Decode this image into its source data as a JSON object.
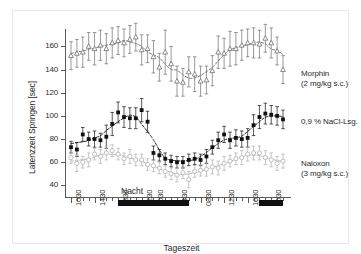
{
  "axes": {
    "ylabel": "Latenzzeit Springen [sec]",
    "xlabel": "Tageszeit",
    "yticks": [
      40,
      60,
      80,
      100,
      120,
      140,
      160
    ],
    "xticklabels": [
      "1030",
      "1430",
      "1830",
      "2230",
      "0030",
      "0430",
      "0830",
      "1230",
      "1630",
      "2030"
    ]
  },
  "annotations": {
    "night_label": "Nacht"
  },
  "legend": {
    "morphin_line1": "Morphin",
    "morphin_line2": "(2 mg/kg s.c.)",
    "nacl_line1": "0,9 % NaCl-Lsg.",
    "naloxon_line1": "Naloxon",
    "naloxon_line2": "(3 mg/kg s.c.)"
  },
  "colors": {
    "morphin": "#6f6f6f",
    "nacl": "#111111",
    "naloxon": "#b0b0b0",
    "axis": "#5a5a5a",
    "night": "#111111"
  },
  "chart_data": {
    "type": "line",
    "title": "",
    "xlabel": "Tageszeit",
    "ylabel": "Latenzzeit Springen [sec]",
    "ylim": [
      30,
      175
    ],
    "yticks": [
      40,
      60,
      80,
      100,
      120,
      140,
      160
    ],
    "grid": false,
    "legend_position": "right",
    "x": [
      "1030",
      "1130",
      "1230",
      "1330",
      "1430",
      "1530",
      "1630",
      "1730",
      "1830",
      "1930",
      "2030",
      "2130",
      "2230",
      "2330",
      "0030",
      "0130",
      "0230",
      "0330",
      "0430",
      "0530",
      "0630",
      "0730",
      "0830",
      "0930",
      "1030",
      "1130",
      "1230",
      "1330",
      "1430",
      "1530",
      "1630",
      "1730",
      "1830",
      "1930",
      "2030",
      "2130",
      "2230"
    ],
    "xticklabels": [
      "1030",
      "1430",
      "1830",
      "2230",
      "0030",
      "0430",
      "0830",
      "1230",
      "1630",
      "2030"
    ],
    "night_bars": [
      {
        "start": "1830",
        "end": "0630"
      },
      {
        "start": "1830",
        "end": "2230"
      }
    ],
    "series": [
      {
        "name": "Morphin (2 mg/kg s.c.)",
        "marker": "open-triangle",
        "color": "#6f6f6f",
        "values": [
          152,
          154,
          155,
          160,
          158,
          161,
          158,
          163,
          165,
          163,
          166,
          168,
          157,
          158,
          151,
          142,
          155,
          145,
          130,
          129,
          138,
          136,
          130,
          131,
          139,
          155,
          154,
          158,
          158,
          161,
          163,
          163,
          162,
          167,
          163,
          156,
          140
        ],
        "errors": [
          12,
          12,
          13,
          12,
          14,
          13,
          13,
          13,
          12,
          12,
          12,
          12,
          13,
          12,
          14,
          12,
          19,
          15,
          13,
          12,
          13,
          15,
          13,
          12,
          13,
          14,
          13,
          15,
          14,
          13,
          12,
          13,
          12,
          12,
          13,
          12,
          12
        ]
      },
      {
        "name": "0,9 % NaCl-Lsg.",
        "marker": "filled-square",
        "color": "#111111",
        "values": [
          73,
          71,
          84,
          80,
          80,
          79,
          82,
          93,
          103,
          99,
          98,
          98,
          105,
          95,
          68,
          66,
          63,
          61,
          60,
          60,
          62,
          63,
          62,
          65,
          73,
          79,
          84,
          79,
          81,
          80,
          81,
          92,
          99,
          102,
          101,
          100,
          97
        ],
        "errors": [
          5,
          6,
          6,
          6,
          7,
          6,
          10,
          10,
          9,
          9,
          9,
          9,
          10,
          9,
          6,
          5,
          5,
          5,
          5,
          5,
          5,
          5,
          5,
          6,
          6,
          7,
          7,
          7,
          7,
          7,
          8,
          9,
          10,
          9,
          8,
          8,
          8
        ]
      },
      {
        "name": "Naloxon (3 mg/kg s.c.)",
        "marker": "open-circle",
        "color": "#b0b0b0",
        "values": [
          64,
          59,
          60,
          62,
          67,
          65,
          68,
          70,
          67,
          63,
          65,
          62,
          62,
          58,
          57,
          55,
          52,
          50,
          49,
          51,
          45,
          52,
          53,
          54,
          56,
          55,
          59,
          61,
          63,
          64,
          67,
          68,
          68,
          64,
          62,
          59,
          61
        ],
        "errors": [
          5,
          7,
          5,
          6,
          5,
          6,
          6,
          5,
          5,
          5,
          6,
          5,
          5,
          5,
          5,
          5,
          5,
          5,
          6,
          5,
          7,
          5,
          5,
          6,
          6,
          6,
          6,
          5,
          5,
          6,
          6,
          6,
          6,
          6,
          6,
          6,
          6
        ]
      }
    ]
  }
}
